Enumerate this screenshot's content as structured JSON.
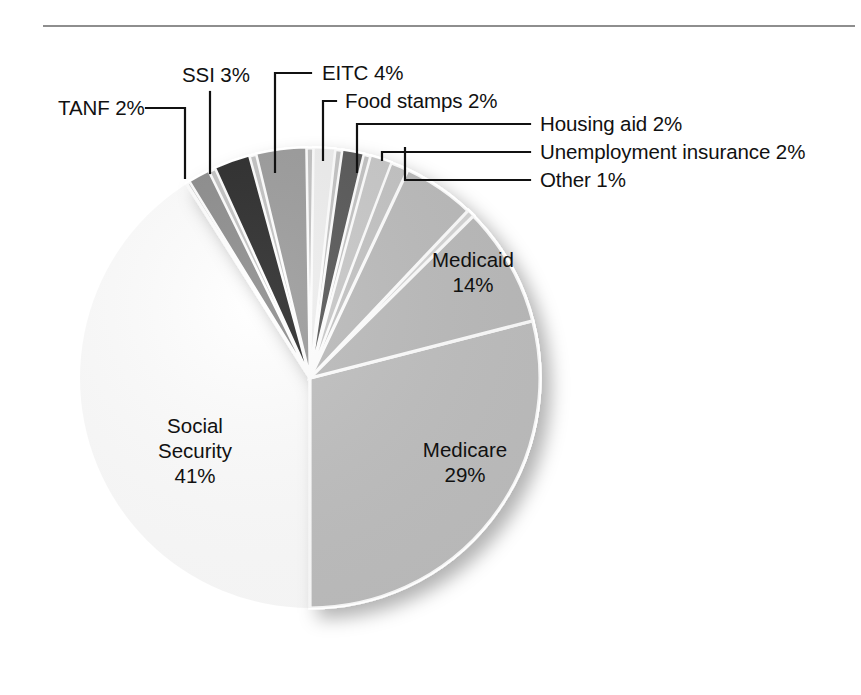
{
  "figure": {
    "type": "pie-chart",
    "rule_color": "#8e8e8e",
    "background": "#ffffff"
  },
  "chart_data": {
    "type": "pie",
    "title": "",
    "xlabel": "",
    "ylabel": "",
    "units": "percent",
    "total": 100,
    "legend_position": "callout-labels",
    "grid": false,
    "categories": [
      "EITC",
      "Food stamps",
      "Housing aid",
      "Unemployment insurance",
      "Other",
      "Medicaid",
      "Medicare",
      "Social Security",
      "TANF",
      "SSI"
    ],
    "values": [
      4,
      2,
      2,
      2,
      1,
      14,
      29,
      41,
      2,
      3
    ],
    "slices": [
      {
        "label": "EITC",
        "value": 4,
        "value_text": "4%",
        "color": "#9c9c9c",
        "label_text": "EITC 4%",
        "placement": "callout"
      },
      {
        "label": "Food stamps",
        "value": 2,
        "value_text": "2%",
        "color": "#efefef",
        "label_text": "Food stamps 2%",
        "placement": "callout"
      },
      {
        "label": "Housing aid",
        "value": 2,
        "value_text": "2%",
        "color": "#585858",
        "label_text": "Housing aid 2%",
        "placement": "callout"
      },
      {
        "label": "Unemployment insurance",
        "value": 2,
        "value_text": "2%",
        "color": "#c9c9c9",
        "label_text": "Unemployment insurance 2%",
        "placement": "callout"
      },
      {
        "label": "Other",
        "value": 1,
        "value_text": "1%",
        "color": "#d6d6d6",
        "label_text": "Other 1%",
        "placement": "callout"
      },
      {
        "label": "Medicaid",
        "value": 14,
        "value_text": "14%",
        "color": "#bcbcbc",
        "label_text": "Medicaid",
        "placement": "inside"
      },
      {
        "label": "Medicare",
        "value": 29,
        "value_text": "29%",
        "color": "#c0c0c0",
        "label_text": "Medicare",
        "placement": "inside"
      },
      {
        "label": "Social Security",
        "value": 41,
        "value_text": "41%",
        "color": "#c4c4c4",
        "label_text": "Social Security",
        "placement": "inside"
      },
      {
        "label": "TANF",
        "value": 2,
        "value_text": "2%",
        "color": "#8d8d8d",
        "label_text": "TANF 2%",
        "placement": "callout"
      },
      {
        "label": "SSI",
        "value": 3,
        "value_text": "3%",
        "color": "#2b2b2b",
        "label_text": "SSI 3%",
        "placement": "callout"
      }
    ]
  },
  "callouts": {
    "tanf": "TANF 2%",
    "ssi": "SSI 3%",
    "eitc": "EITC 4%",
    "food_stamps": "Food stamps 2%",
    "housing_aid": "Housing aid 2%",
    "unemployment": "Unemployment insurance 2%",
    "other": "Other 1%"
  },
  "inside_labels": {
    "medicaid_name": "Medicaid",
    "medicaid_value": "14%",
    "medicare_name": "Medicare",
    "medicare_value": "29%",
    "social_security_line1": "Social",
    "social_security_line2": "Security",
    "social_security_value": "41%"
  }
}
